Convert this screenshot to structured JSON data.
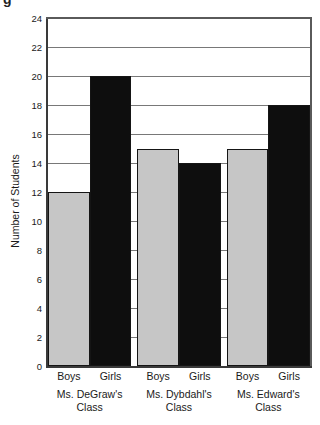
{
  "page": {
    "cropped_text_fragment": "g"
  },
  "chart_data": {
    "type": "bar",
    "title": "",
    "ylabel": "Number of Students",
    "xlabel": "",
    "ylim": [
      0,
      24
    ],
    "ytick_step": 2,
    "yticks": [
      0,
      2,
      4,
      6,
      8,
      10,
      12,
      14,
      16,
      18,
      20,
      22,
      24
    ],
    "grid": true,
    "legend": "none",
    "categories": [
      "Ms. DeGraw's Class",
      "Ms. Dybdahl's Class",
      "Ms. Edward's Class"
    ],
    "category_label_lines": [
      [
        "Ms. DeGraw's",
        "Class"
      ],
      [
        "Ms. Dybdahl's",
        "Class"
      ],
      [
        "Ms. Edward's",
        "Class"
      ]
    ],
    "bar_labels": [
      "Boys",
      "Girls"
    ],
    "series": [
      {
        "name": "Boys",
        "color": "#c6c6c6",
        "values": [
          12,
          15,
          15
        ]
      },
      {
        "name": "Girls",
        "color": "#0e0e0e",
        "values": [
          20,
          14,
          18
        ]
      }
    ]
  }
}
